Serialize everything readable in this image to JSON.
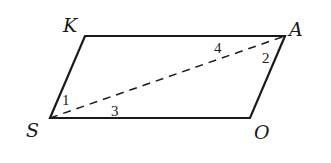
{
  "diagram": {
    "type": "parallelogram",
    "stroke_color": "#1a1a1a",
    "vertices": {
      "K": {
        "label": "K",
        "x": 85,
        "y": 36
      },
      "A": {
        "label": "A",
        "x": 285,
        "y": 36
      },
      "O": {
        "label": "O",
        "x": 250,
        "y": 118
      },
      "S": {
        "label": "S",
        "x": 50,
        "y": 118
      }
    },
    "diagonal": {
      "from": "S",
      "to": "A",
      "style": "dashed"
    },
    "angles": [
      {
        "label": "1",
        "vertex": "S",
        "between": "SK and SA"
      },
      {
        "label": "2",
        "vertex": "A",
        "between": "AS and AO"
      },
      {
        "label": "3",
        "vertex": "S",
        "between": "SA and SO"
      },
      {
        "label": "4",
        "vertex": "A",
        "between": "AK and AS"
      }
    ]
  }
}
